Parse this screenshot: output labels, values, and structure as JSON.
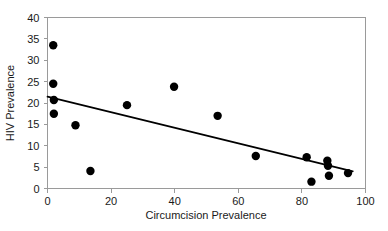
{
  "chart_data": {
    "type": "scatter",
    "title": "",
    "xlabel": "Circumcision Prevalence",
    "ylabel": "HIV Prevalence",
    "xlim": [
      0,
      100
    ],
    "ylim": [
      0,
      40
    ],
    "xticks": [
      0,
      20,
      40,
      60,
      80,
      100
    ],
    "yticks": [
      0,
      5,
      10,
      15,
      20,
      25,
      30,
      35,
      40
    ],
    "xtick_labels": [
      "0",
      "20",
      "40",
      "60",
      "80",
      "100"
    ],
    "ytick_labels": [
      "0",
      "5",
      "10",
      "15",
      "20",
      "25",
      "30",
      "35",
      "40"
    ],
    "grid": false,
    "legend": false,
    "marker": "filled-circle",
    "marker_color": "#000000",
    "points": [
      {
        "x": 1.8,
        "y": 33.5
      },
      {
        "x": 1.8,
        "y": 24.5
      },
      {
        "x": 2.0,
        "y": 20.7
      },
      {
        "x": 2.0,
        "y": 17.5
      },
      {
        "x": 8.8,
        "y": 14.8
      },
      {
        "x": 13.5,
        "y": 4.1
      },
      {
        "x": 25.0,
        "y": 19.5
      },
      {
        "x": 39.8,
        "y": 23.8
      },
      {
        "x": 53.5,
        "y": 17.0
      },
      {
        "x": 65.5,
        "y": 7.6
      },
      {
        "x": 81.5,
        "y": 7.3
      },
      {
        "x": 83.0,
        "y": 1.6
      },
      {
        "x": 88.0,
        "y": 6.5
      },
      {
        "x": 88.2,
        "y": 5.3
      },
      {
        "x": 88.5,
        "y": 3.0
      },
      {
        "x": 94.5,
        "y": 3.6
      }
    ],
    "trend_line": {
      "type": "linear-fit",
      "x0": 0.0,
      "y0": 21.5,
      "x1": 96.0,
      "y1": 4.0,
      "color": "#000000"
    }
  }
}
